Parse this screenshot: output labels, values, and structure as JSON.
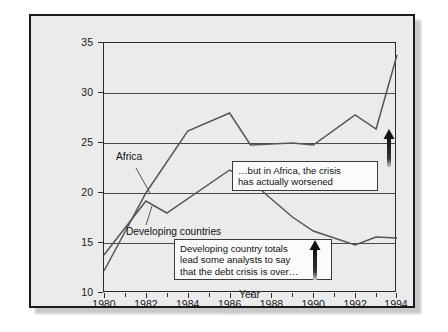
{
  "chart_data": {
    "type": "line",
    "title": "",
    "xlabel": "Year",
    "ylabel": "Debt service as percentage of exports",
    "xlim": [
      1980,
      1994
    ],
    "ylim": [
      10,
      35
    ],
    "yticks": [
      10,
      15,
      20,
      25,
      30,
      35
    ],
    "xticks": [
      1980,
      1982,
      1984,
      1986,
      1988,
      1990,
      1992,
      1994
    ],
    "xtick_labels": [
      "1980",
      "1982",
      "1984",
      "1986",
      "1988",
      "1990",
      "1992",
      "1994"
    ],
    "ytick_labels": [
      "10",
      "15",
      "20",
      "25",
      "30",
      "35"
    ],
    "grid": "horizontal",
    "legend": "inline-labels",
    "x": [
      1980,
      1981,
      1982,
      1983,
      1984,
      1985,
      1986,
      1987,
      1988,
      1989,
      1990,
      1991,
      1992,
      1993,
      1994
    ],
    "series": [
      {
        "name": "Africa",
        "color": "#555555",
        "values": [
          12.2,
          16.0,
          20.0,
          22.4,
          26.2,
          27.3,
          28.0,
          24.8,
          23.4,
          22.3,
          21.0,
          20.2,
          19.4,
          20.0,
          15.6
        ]
      },
      {
        "name": "Developing countries",
        "color": "#555555",
        "values": [
          13.8,
          16.6,
          19.2,
          18.3,
          18.0,
          19.3,
          20.0,
          22.3,
          21.0,
          20.5,
          20.6,
          21.4,
          22.0,
          21.3,
          24.5
        ]
      }
    ],
    "annotations": [
      {
        "name": "africa-callout",
        "text": "…but in Africa, the crisis has actually worsened"
      },
      {
        "name": "developing-callout",
        "text": "Developing country totals lead some analysts to say that the debt crisis is over…"
      }
    ],
    "series_labels": [
      "Africa",
      "Developing countries"
    ],
    "africa_line_points": "1980:12.2 1982:20.0 1984:26.2 1986:28.0 1987:24.8 1989:25.0 1990:24.8 1992:27.8 1993:26.4 1994:33.8",
    "developing_line_points": "1980:13.8 1982:19.2 1983:18.0 1986:22.3 1987:21.2 1989:17.6 1990:16.2 1992:14.8 1993:15.6 1994:15.5"
  },
  "labels": {
    "africa": "Africa",
    "developing": "Developing countries",
    "year_axis": "Year",
    "value_axis": "Debt service as percentage of exports"
  },
  "callouts": {
    "africa_line1": "…but in Africa, the crisis",
    "africa_line2": "has actually worsened",
    "developing_line1": "Developing country totals",
    "developing_line2": "lead some analysts to say",
    "developing_line3": "that the debt crisis is over…"
  },
  "colors": {
    "panel": "#ebebeb",
    "line": "#555555",
    "frame": "#1a1a1a",
    "callout_bg": "#fbfbfb"
  }
}
